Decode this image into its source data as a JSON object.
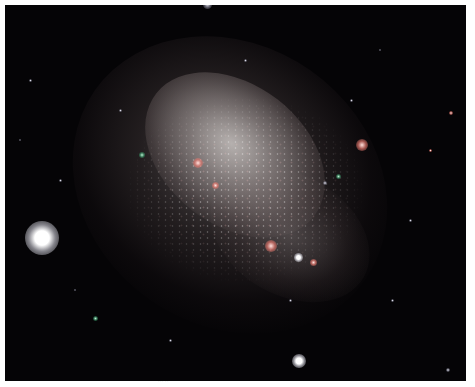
{
  "image": {
    "subject": "dwarf irregular galaxy star field",
    "background_color": "#050406",
    "frame_color": "#ffffff",
    "caption": "··· ··"
  },
  "stars": [
    {
      "name": "bright-star-left",
      "x": 42,
      "y": 238,
      "size": 34,
      "type": "bright"
    },
    {
      "name": "bright-star-bottom",
      "x": 299,
      "y": 361,
      "size": 14,
      "type": "bright"
    },
    {
      "name": "star-top",
      "x": 207,
      "y": 4,
      "size": 9,
      "type": "dim"
    },
    {
      "name": "hii-region-right",
      "x": 362,
      "y": 145,
      "size": 12,
      "type": "pink"
    },
    {
      "name": "hii-region-lower",
      "x": 271,
      "y": 246,
      "size": 12,
      "type": "pink"
    },
    {
      "name": "hii-region-lower-2",
      "x": 298,
      "y": 257,
      "size": 9,
      "type": "bright"
    },
    {
      "name": "hii-region-core",
      "x": 198,
      "y": 163,
      "size": 10,
      "type": "pink"
    },
    {
      "name": "hii-region-core-2",
      "x": 215,
      "y": 185,
      "size": 7,
      "type": "pink"
    },
    {
      "name": "hii-region-edge",
      "x": 313,
      "y": 262,
      "size": 7,
      "type": "pink"
    },
    {
      "name": "green-star-1",
      "x": 142,
      "y": 155,
      "size": 6,
      "type": "green"
    },
    {
      "name": "green-star-2",
      "x": 338,
      "y": 176,
      "size": 5,
      "type": "green"
    },
    {
      "name": "green-star-3",
      "x": 95,
      "y": 318,
      "size": 5,
      "type": "green"
    },
    {
      "name": "star-small-1",
      "x": 325,
      "y": 183,
      "size": 4,
      "type": "dim"
    },
    {
      "name": "star-small-2",
      "x": 351,
      "y": 100,
      "size": 3,
      "type": "dim"
    },
    {
      "name": "star-small-3",
      "x": 245,
      "y": 60,
      "size": 3,
      "type": "dim"
    },
    {
      "name": "star-small-4",
      "x": 60,
      "y": 180,
      "size": 3,
      "type": "dim"
    },
    {
      "name": "star-small-5",
      "x": 451,
      "y": 113,
      "size": 4,
      "type": "pink"
    },
    {
      "name": "star-small-6",
      "x": 448,
      "y": 370,
      "size": 4,
      "type": "dim"
    },
    {
      "name": "star-small-7",
      "x": 410,
      "y": 220,
      "size": 3,
      "type": "dim"
    },
    {
      "name": "star-small-8",
      "x": 170,
      "y": 340,
      "size": 3,
      "type": "dim"
    },
    {
      "name": "star-small-9",
      "x": 30,
      "y": 80,
      "size": 3,
      "type": "dim"
    },
    {
      "name": "star-small-10",
      "x": 392,
      "y": 300,
      "size": 3,
      "type": "dim"
    },
    {
      "name": "star-small-11",
      "x": 120,
      "y": 110,
      "size": 3,
      "type": "dim"
    },
    {
      "name": "star-small-12",
      "x": 430,
      "y": 150,
      "size": 3,
      "type": "pink"
    },
    {
      "name": "star-small-13",
      "x": 290,
      "y": 300,
      "size": 3,
      "type": "dim"
    },
    {
      "name": "star-small-14",
      "x": 75,
      "y": 290,
      "size": 2,
      "type": "dim"
    },
    {
      "name": "star-small-15",
      "x": 380,
      "y": 50,
      "size": 2,
      "type": "dim"
    },
    {
      "name": "star-small-16",
      "x": 20,
      "y": 140,
      "size": 2,
      "type": "dim"
    }
  ]
}
